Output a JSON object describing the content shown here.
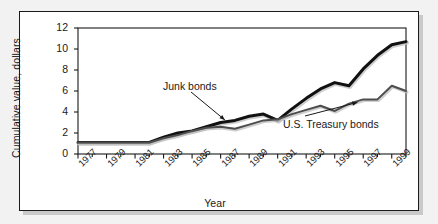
{
  "chart_data": {
    "type": "line",
    "title": "",
    "xlabel": "Year",
    "ylabel": "Cumulative value, dollars",
    "xlim": [
      1977,
      2000
    ],
    "ylim": [
      0,
      12
    ],
    "ytick_labels": [
      "0",
      "2",
      "4",
      "6",
      "8",
      "10",
      "12"
    ],
    "ytick_values": [
      0,
      2,
      4,
      6,
      8,
      10,
      12
    ],
    "xtick_labels": [
      "1977",
      "1979",
      "1981",
      "1983",
      "1985",
      "1987",
      "1989",
      "1991",
      "1993",
      "1995",
      "1997",
      "1999"
    ],
    "xtick_values": [
      1977,
      1979,
      1981,
      1983,
      1985,
      1987,
      1989,
      1991,
      1993,
      1995,
      1997,
      1999
    ],
    "grid": false,
    "legend_position": "inline-annotations",
    "x": [
      1977,
      1978,
      1979,
      1980,
      1981,
      1982,
      1983,
      1984,
      1985,
      1986,
      1987,
      1988,
      1989,
      1990,
      1991,
      1992,
      1993,
      1994,
      1995,
      1996,
      1997,
      1998,
      1999,
      2000
    ],
    "series": [
      {
        "name": "Junk bonds",
        "color": "#111111",
        "width": 3.0,
        "values": [
          1.1,
          1.1,
          1.1,
          1.1,
          1.1,
          1.1,
          1.6,
          2.0,
          2.2,
          2.6,
          3.0,
          3.2,
          3.6,
          3.8,
          3.2,
          4.3,
          5.3,
          6.2,
          6.8,
          6.5,
          8.1,
          9.4,
          10.4,
          10.7
        ]
      },
      {
        "name": "U.S. Treasury bonds",
        "color": "#4d4d4d",
        "width": 2.0,
        "values": [
          1.1,
          1.1,
          1.1,
          1.1,
          1.1,
          1.1,
          1.5,
          1.8,
          2.2,
          2.5,
          2.6,
          2.4,
          2.8,
          3.2,
          3.3,
          3.8,
          4.2,
          4.6,
          4.1,
          4.8,
          5.2,
          5.2,
          6.5,
          6.0
        ]
      }
    ],
    "annotations": [
      {
        "label": "Junk bonds",
        "points_to_series": "Junk bonds",
        "points_to_x": 1987.3,
        "points_to_y": 3.05
      },
      {
        "label": "U.S. Treasury bonds",
        "points_to_series": "U.S. Treasury bonds",
        "points_to_x": 1996.6,
        "points_to_y": 5.2
      }
    ]
  },
  "colors": {
    "page_background": "#f2f2f2",
    "figure_background": "#ffffff",
    "frame": "#1a1a1a",
    "shadow": "#c9c9c9",
    "axis": "#1a1a1a",
    "junk_bonds": "#111111",
    "treasury_bonds": "#4d4d4d",
    "text": "#1a1a1a"
  }
}
